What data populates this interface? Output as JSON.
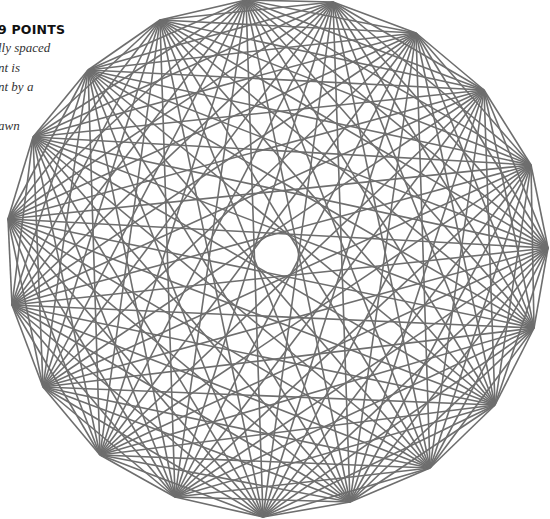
{
  "caption": {
    "title": "9 POINTS",
    "lines": [
      "lly spaced",
      "nt is",
      "nt by a",
      "",
      "awn"
    ]
  },
  "graph": {
    "type": "complete-graph",
    "point_count": 19,
    "line_color": "#6e6e6e",
    "line_width": 1.6,
    "points": [
      [
        246,
        0
      ],
      [
        333,
        2
      ],
      [
        416,
        33
      ],
      [
        484,
        90
      ],
      [
        531,
        165
      ],
      [
        548,
        248
      ],
      [
        534,
        328
      ],
      [
        495,
        405
      ],
      [
        430,
        468
      ],
      [
        350,
        502
      ],
      [
        263,
        517
      ],
      [
        175,
        497
      ],
      [
        100,
        455
      ],
      [
        43,
        387
      ],
      [
        12,
        305
      ],
      [
        8,
        219
      ],
      [
        33,
        137
      ],
      [
        88,
        70
      ],
      [
        160,
        20
      ]
    ]
  }
}
